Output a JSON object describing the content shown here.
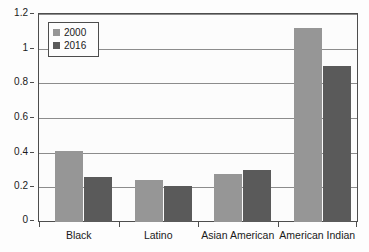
{
  "chart_data": {
    "type": "bar",
    "title": "",
    "subtitle": "",
    "xlabel": "",
    "ylabel": "",
    "categories": [
      "Black",
      "Latino",
      "Asian American",
      "American Indian"
    ],
    "series": [
      {
        "name": "2000",
        "color": "#969696",
        "values": [
          0.41,
          0.24,
          0.275,
          1.12
        ]
      },
      {
        "name": "2016",
        "color": "#5a5a5a",
        "values": [
          0.26,
          0.205,
          0.3,
          0.9
        ]
      }
    ],
    "ylim": [
      0,
      1.2
    ],
    "yticks": [
      0,
      0.2,
      0.4,
      0.6,
      0.8,
      1,
      1.2
    ],
    "ytick_labels": [
      "0",
      "0.2",
      "0.4",
      "0.6",
      "0.8",
      "1",
      "1.2"
    ],
    "grid": true,
    "grid_axis": "y",
    "legend": [
      "2000",
      "2016"
    ],
    "legend_position": "top-left",
    "annotations": []
  }
}
